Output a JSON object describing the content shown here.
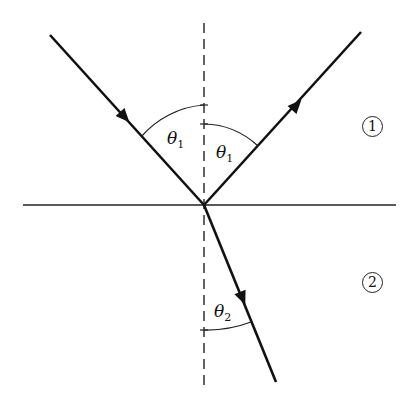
{
  "diagram": {
    "labels": {
      "theta_incident": "θ",
      "theta_incident_sub": "1",
      "theta_reflected": "θ",
      "theta_reflected_sub": "1",
      "theta_refracted": "θ",
      "theta_refracted_sub": "2",
      "medium_1": "1",
      "medium_2": "2"
    },
    "geometry": {
      "vertex": [
        204,
        205
      ],
      "incident_start": [
        50,
        35
      ],
      "reflected_end": [
        361,
        32
      ],
      "refracted_end": [
        276,
        382
      ],
      "interface_y": 205,
      "interface_x": [
        23,
        396
      ],
      "normal_x": 204,
      "normal_y": [
        23,
        391
      ]
    },
    "colors": {
      "line": "#111111",
      "background": "#ffffff"
    }
  }
}
